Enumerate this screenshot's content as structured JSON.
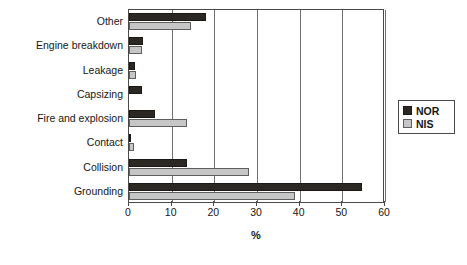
{
  "chart_data": {
    "type": "bar",
    "orientation": "horizontal",
    "title": "",
    "xlabel": "%",
    "ylabel": "",
    "xlim": [
      0,
      60
    ],
    "xticks": [
      0,
      10,
      20,
      30,
      40,
      50,
      60
    ],
    "grid": true,
    "legend_position": "right",
    "categories": [
      "Grounding",
      "Collision",
      "Contact",
      "Fire and explosion",
      "Capsizing",
      "Leakage",
      "Engine breakdown",
      "Other"
    ],
    "series": [
      {
        "name": "NOR",
        "color": "#2b2722",
        "values": [
          54.6,
          13.5,
          0.4,
          6.1,
          3.1,
          1.4,
          3.3,
          18.0
        ]
      },
      {
        "name": "NIS",
        "color": "#c6c6c6",
        "values": [
          38.8,
          28.2,
          1.2,
          13.5,
          0.0,
          1.7,
          3.0,
          14.6
        ]
      }
    ]
  },
  "legend": {
    "items": [
      {
        "label": "NOR",
        "swatch": "black-square-swatch"
      },
      {
        "label": "NIS",
        "swatch": "gray-square-swatch"
      }
    ]
  },
  "axis": {
    "x_title": "%",
    "tick_labels": [
      "0",
      "10",
      "20",
      "30",
      "40",
      "50",
      "60"
    ]
  }
}
